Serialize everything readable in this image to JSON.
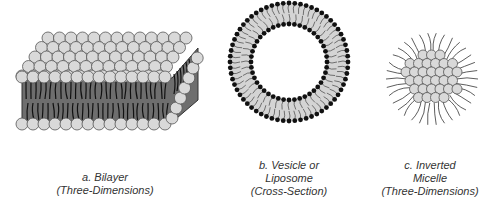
{
  "figures": [
    {
      "id": "bilayer",
      "caption_lines": [
        "a. Bilayer",
        "(Three-Dimensions)"
      ]
    },
    {
      "id": "vesicle",
      "caption_lines": [
        "b. Vesicle or",
        "Liposome",
        "(Cross-Section)"
      ]
    },
    {
      "id": "micelle",
      "caption_lines": [
        "c. Inverted",
        "Micelle",
        "(Three-Dimensions)"
      ]
    }
  ],
  "colors": {
    "head_fill": "#d9d9d9",
    "head_stroke": "#555555",
    "bilayer_core": "#6e6e6e",
    "tail": "#111111",
    "vesicle_band": "#d4d4d4",
    "vesicle_head": "#111111"
  }
}
